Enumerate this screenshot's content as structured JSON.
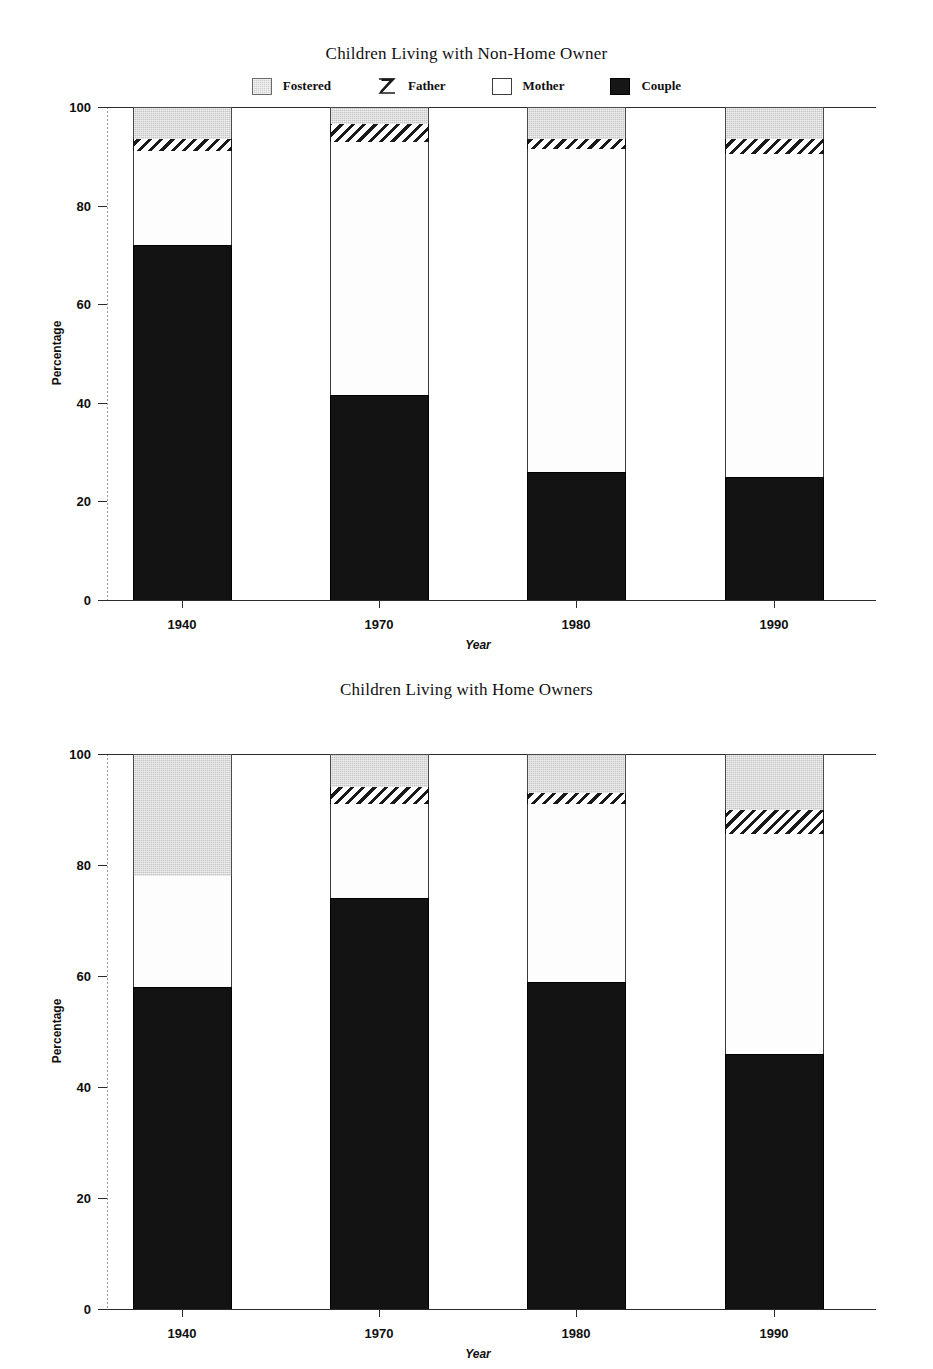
{
  "legend": {
    "entries": [
      {
        "label": "Fostered",
        "swatch": "fostered-swatch-icon",
        "color": "#c6c6c6"
      },
      {
        "label": "Father",
        "swatch": "father-hatch-swatch-icon",
        "color": "#1a1a1a"
      },
      {
        "label": "Mother",
        "swatch": "mother-swatch-icon",
        "color": "#ffffff"
      },
      {
        "label": "Couple",
        "swatch": "couple-swatch-icon",
        "color": "#131313"
      }
    ]
  },
  "charts": [
    {
      "id": "non-home-owner",
      "title": "Children Living with Non-Home Owner",
      "xlabel": "Year",
      "ylabel": "Percentage"
    },
    {
      "id": "home-owners",
      "title": "Children Living with Home Owners",
      "xlabel": "Year",
      "ylabel": "Percentage"
    }
  ],
  "axis": {
    "yticks": [
      "0",
      "20",
      "40",
      "60",
      "80",
      "100"
    ],
    "xticks": [
      "1940",
      "1970",
      "1980",
      "1990"
    ]
  },
  "chart_data": [
    {
      "type": "bar",
      "stacked": true,
      "title": "Children Living with Non-Home Owner",
      "xlabel": "Year",
      "ylabel": "Percentage",
      "ylim": [
        0,
        100
      ],
      "ytick_values": [
        0,
        20,
        40,
        60,
        80,
        100
      ],
      "grid": false,
      "legend_position": "top",
      "categories": [
        "1940",
        "1970",
        "1980",
        "1990"
      ],
      "series": [
        {
          "name": "Couple",
          "values": [
            72.0,
            41.5,
            26.0,
            25.0
          ]
        },
        {
          "name": "Mother",
          "values": [
            19.0,
            51.5,
            65.5,
            65.5
          ]
        },
        {
          "name": "Father",
          "values": [
            2.5,
            3.5,
            2.0,
            3.0
          ]
        },
        {
          "name": "Fostered",
          "values": [
            6.5,
            3.5,
            6.5,
            6.5
          ]
        }
      ],
      "stack_order_bottom_to_top": [
        "Couple",
        "Mother",
        "Father",
        "Fostered"
      ]
    },
    {
      "type": "bar",
      "stacked": true,
      "title": "Children Living with Home Owners",
      "xlabel": "Year",
      "ylabel": "Percentage",
      "ylim": [
        0,
        100
      ],
      "ytick_values": [
        0,
        20,
        40,
        60,
        80,
        100
      ],
      "grid": false,
      "legend_position": "top",
      "categories": [
        "1940",
        "1970",
        "1980",
        "1990"
      ],
      "series": [
        {
          "name": "Couple",
          "values": [
            58.0,
            74.0,
            59.0,
            46.0
          ]
        },
        {
          "name": "Mother",
          "values": [
            20.0,
            17.0,
            32.0,
            39.5
          ]
        },
        {
          "name": "Father",
          "values": [
            0.0,
            3.0,
            2.0,
            4.5
          ]
        },
        {
          "name": "Fostered",
          "values": [
            22.0,
            6.0,
            7.0,
            10.0
          ]
        }
      ],
      "stack_order_bottom_to_top": [
        "Couple",
        "Mother",
        "Father",
        "Fostered"
      ]
    }
  ]
}
